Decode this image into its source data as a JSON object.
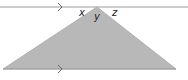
{
  "diagram": {
    "type": "parallel-lines-triangle",
    "angle_labels": {
      "left": "x",
      "middle": "y",
      "right": "z"
    },
    "parallel_markers": 2,
    "colors": {
      "triangle_fill": "#b8b8b8",
      "line": "#9a9a9a",
      "text": "#222222"
    }
  }
}
